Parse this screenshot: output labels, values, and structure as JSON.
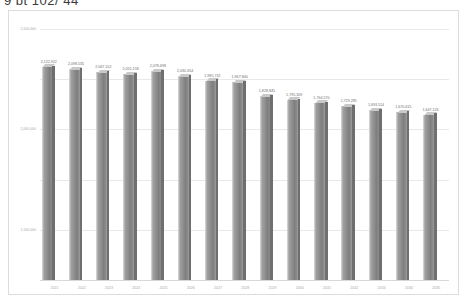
{
  "window": {
    "title_fragment": "9 bt 102/ 44"
  },
  "chart_data": {
    "type": "bar",
    "title": "",
    "xlabel": "",
    "ylabel": "",
    "ylim": [
      0,
      2500000
    ],
    "grid": true,
    "legend": "none",
    "y_ticks": [
      "0",
      "500,000",
      "1,000,000",
      "1,500,000",
      "2,000,000",
      "2,500,000"
    ],
    "y_tick_values": [
      0,
      500000,
      1000000,
      1500000,
      2000000,
      2500000
    ],
    "categories": [
      "2021",
      "2022",
      "2023",
      "2024",
      "2025",
      "2026",
      "2027",
      "2028",
      "2029",
      "2030",
      "2031",
      "2032",
      "2033",
      "2034",
      "2035"
    ],
    "values": [
      2122922,
      2098535,
      2067102,
      2052158,
      2078698,
      2030654,
      1985732,
      1967840,
      1828845,
      1795309,
      1764570,
      1729285,
      1693514,
      1670615,
      1647126
    ],
    "value_labels": [
      "2,122,922",
      "2,098,535",
      "2,067,102",
      "2,052,158",
      "2,078,698",
      "2,030,654",
      "1,985,732",
      "1,967,840",
      "1,828,845",
      "1,795,309",
      "1,764,570",
      "1,729,285",
      "1,693,514",
      "1,670,615",
      "1,647,126"
    ]
  },
  "colors": {
    "bar_face": "#8e8e8e",
    "bar_top": "#c9c9c9",
    "bar_side": "#6f6f6f",
    "gridline": "#e8e8e8",
    "frame": "#dcdcdc",
    "tick_text": "#a8a8a8",
    "label_text": "#6d6d6d",
    "background": "#ffffff"
  }
}
